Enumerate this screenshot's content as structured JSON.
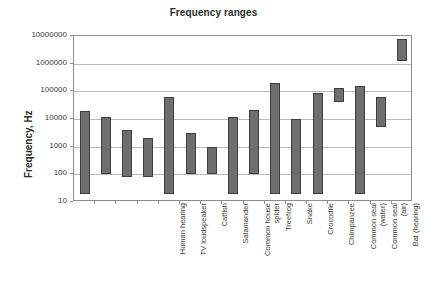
{
  "chart_data": {
    "type": "bar",
    "subtype": "floating-range-bar",
    "title": "Frequency ranges",
    "xlabel": "",
    "ylabel": "Frequency, Hz",
    "yscale": "log",
    "ylim": [
      10,
      10000000
    ],
    "ytick_labels": [
      "10000000",
      "1000000",
      "100000",
      "10000",
      "1000",
      "100",
      "10"
    ],
    "ytick_values": [
      10000000,
      1000000,
      100000,
      10000,
      1000,
      100,
      10
    ],
    "grid": true,
    "legend": "none",
    "categories": [
      "Human hearing",
      "TV loudspeaker",
      "Catfish",
      "Salamander",
      "Common house spider",
      "Treefrog",
      "Snake",
      "Crocodile",
      "Chimpanzee",
      "Common seal (water)",
      "Common seal (air)",
      "Bat (hearing)",
      "Bat (echo-location)",
      "Toothed whales",
      "Submarine sonar",
      "Diagnostic ultrasound"
    ],
    "category_label_lines": [
      [
        "Human hearing"
      ],
      [
        "TV loudspeaker"
      ],
      [
        "Catfish"
      ],
      [
        "Salamander"
      ],
      [
        "Common house",
        "spider"
      ],
      [
        "Treefrog"
      ],
      [
        "Snake"
      ],
      [
        "Crocodile"
      ],
      [
        "Chimpanzee"
      ],
      [
        "Common seal",
        "(water)"
      ],
      [
        "Common seal",
        "(air)"
      ],
      [
        "Bat (hearing)"
      ],
      [
        "Bat (echo-",
        "location)"
      ],
      [
        "Toothed whales"
      ],
      [
        "Submarine sonar"
      ],
      [
        "Diagnostic",
        "ultrasound"
      ]
    ],
    "series": [
      {
        "name": "min",
        "values": [
          20,
          100,
          80,
          80,
          20,
          100,
          100,
          20,
          100,
          20,
          20,
          20,
          40000,
          20,
          5000,
          1200000
        ]
      },
      {
        "name": "max",
        "values": [
          20000,
          12000,
          4000,
          2000,
          60000,
          3000,
          1000,
          12000,
          22000,
          200000,
          10000,
          90000,
          130000,
          160000,
          60000,
          8000000
        ]
      }
    ],
    "ranges": [
      {
        "label": "Human hearing",
        "min": 20,
        "max": 20000
      },
      {
        "label": "TV loudspeaker",
        "min": 100,
        "max": 12000
      },
      {
        "label": "Catfish",
        "min": 80,
        "max": 4000
      },
      {
        "label": "Salamander",
        "min": 80,
        "max": 2000
      },
      {
        "label": "Common house spider",
        "min": 20,
        "max": 60000
      },
      {
        "label": "Treefrog",
        "min": 100,
        "max": 3000
      },
      {
        "label": "Snake",
        "min": 100,
        "max": 1000
      },
      {
        "label": "Crocodile",
        "min": 20,
        "max": 12000
      },
      {
        "label": "Chimpanzee",
        "min": 100,
        "max": 22000
      },
      {
        "label": "Common seal (water)",
        "min": 20,
        "max": 200000
      },
      {
        "label": "Common seal (air)",
        "min": 20,
        "max": 10000
      },
      {
        "label": "Bat (hearing)",
        "min": 20,
        "max": 90000
      },
      {
        "label": "Bat (echo-location)",
        "min": 40000,
        "max": 130000
      },
      {
        "label": "Toothed whales",
        "min": 20,
        "max": 160000
      },
      {
        "label": "Submarine sonar",
        "min": 5000,
        "max": 60000
      },
      {
        "label": "Diagnostic ultrasound",
        "min": 1200000,
        "max": 8000000
      }
    ],
    "colors": {
      "bar_fill": "#6e6e6e",
      "bar_border": "#3d3d3d",
      "gridline": "#b9b9b9",
      "axis": "#8d8d8d",
      "text": "#3a3a3a",
      "title": "#2b2b2b",
      "background": "#ffffff"
    }
  }
}
